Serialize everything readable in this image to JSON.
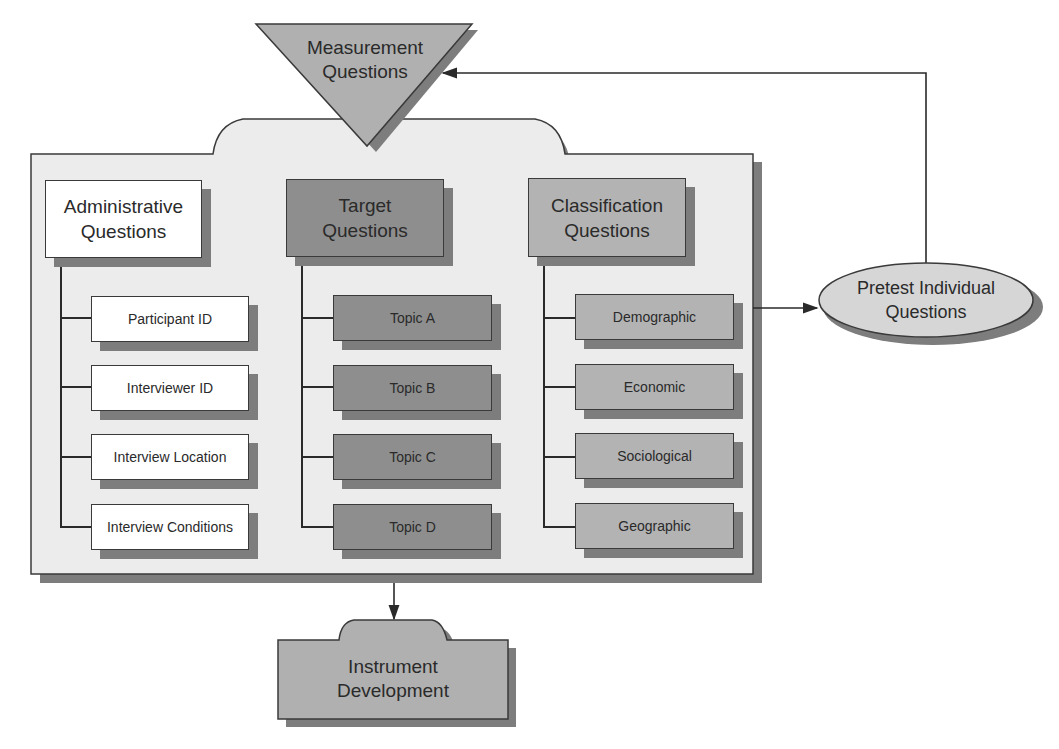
{
  "diagram": {
    "top_node": {
      "label_line1": "Measurement",
      "label_line2": "Questions"
    },
    "columns": [
      {
        "header_line1": "Administrative",
        "header_line2": "Questions",
        "items": [
          "Participant ID",
          "Interviewer ID",
          "Interview Location",
          "Interview Conditions"
        ]
      },
      {
        "header_line1": "Target",
        "header_line2": "Questions",
        "items": [
          "Topic A",
          "Topic B",
          "Topic C",
          "Topic D"
        ]
      },
      {
        "header_line1": "Classification",
        "header_line2": "Questions",
        "items": [
          "Demographic",
          "Economic",
          "Sociological",
          "Geographic"
        ]
      }
    ],
    "pretest_node": {
      "label_line1": "Pretest Individual",
      "label_line2": "Questions"
    },
    "output_node": {
      "label_line1": "Instrument",
      "label_line2": "Development"
    },
    "colors": {
      "administrative": "#ffffff",
      "target": "#8e8e8e",
      "classification": "#b3b3b3",
      "container": "#ececec",
      "shadow": "#7d7d7d"
    }
  }
}
